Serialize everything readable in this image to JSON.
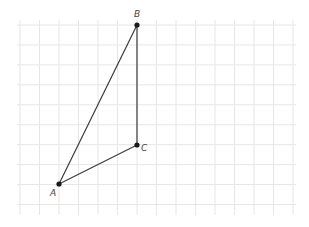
{
  "diagram": {
    "grid": {
      "x0": 20,
      "y0": 25,
      "spacing_x": 19.5,
      "spacing_y": 19.95,
      "cols": 14,
      "rows": 9,
      "extent": {
        "left": 17,
        "right": 296,
        "top": 20,
        "bottom": 215
      },
      "color": "#e6e6e6"
    },
    "points": [
      {
        "label": "A",
        "x": 59,
        "y": 184,
        "label_x": 50,
        "label_y": 196
      },
      {
        "label": "B",
        "x": 137,
        "y": 25,
        "label_x": 134,
        "label_y": 17
      },
      {
        "label": "C",
        "x": 137,
        "y": 145,
        "label_x": 141,
        "label_y": 151
      }
    ],
    "segments": [
      {
        "from": "A",
        "to": "B"
      },
      {
        "from": "B",
        "to": "C"
      },
      {
        "from": "A",
        "to": "C"
      }
    ]
  }
}
